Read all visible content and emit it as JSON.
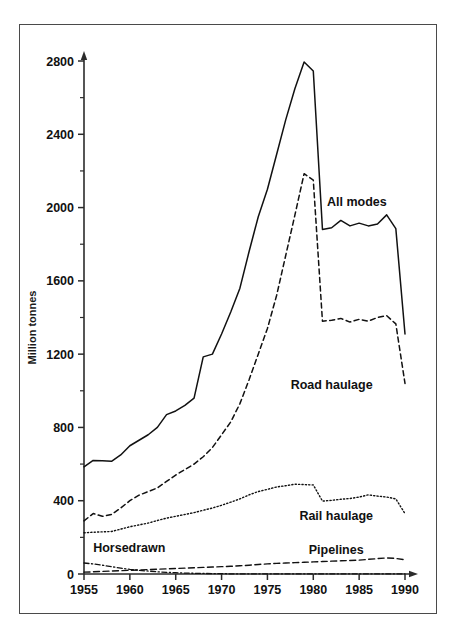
{
  "chart_data": {
    "type": "line",
    "title": "",
    "xlabel": "",
    "ylabel": "Million tonnes",
    "xlim": [
      1955,
      1990
    ],
    "ylim": [
      0,
      2800
    ],
    "yticks": [
      0,
      400,
      800,
      1200,
      1600,
      2000,
      2400,
      2800
    ],
    "ytick_labels": [
      "0",
      "400",
      "800",
      "1200",
      "1600",
      "2000",
      "2400",
      "2800"
    ],
    "yminor_step": 200,
    "xticks": [
      1955,
      1960,
      1965,
      1970,
      1975,
      1980,
      1985,
      1990
    ],
    "xtick_labels": [
      "1955",
      "1960",
      "1965",
      "1970",
      "1975",
      "1980",
      "1985",
      "1990"
    ],
    "grid": false,
    "legend_position": "inline-annotations",
    "x": [
      1955,
      1956,
      1957,
      1958,
      1959,
      1960,
      1961,
      1962,
      1963,
      1964,
      1965,
      1966,
      1967,
      1968,
      1969,
      1970,
      1971,
      1972,
      1973,
      1974,
      1975,
      1976,
      1977,
      1978,
      1979,
      1980,
      1981,
      1982,
      1983,
      1984,
      1985,
      1986,
      1987,
      1988,
      1989,
      1990
    ],
    "series": [
      {
        "name": "All modes",
        "style": "solid",
        "label_x": 1981.5,
        "label_y": 2010,
        "values": [
          585,
          620,
          618,
          615,
          650,
          700,
          730,
          760,
          800,
          870,
          890,
          920,
          960,
          1185,
          1200,
          1310,
          1430,
          1560,
          1760,
          1950,
          2100,
          2290,
          2480,
          2650,
          2795,
          2745,
          1880,
          1890,
          1930,
          1900,
          1915,
          1900,
          1910,
          1960,
          1885,
          1310
        ]
      },
      {
        "name": "Road haulage",
        "style": "dashed",
        "label_x": 1982.0,
        "label_y": 1010,
        "values": [
          290,
          330,
          315,
          325,
          360,
          400,
          430,
          450,
          470,
          505,
          540,
          570,
          600,
          640,
          690,
          760,
          830,
          930,
          1060,
          1200,
          1340,
          1520,
          1740,
          1960,
          2185,
          2150,
          1380,
          1385,
          1395,
          1375,
          1390,
          1380,
          1400,
          1410,
          1365,
          1040
        ]
      },
      {
        "name": "Rail haulage",
        "style": "dotted",
        "label_x": 1982.5,
        "label_y": 295,
        "values": [
          225,
          228,
          230,
          232,
          245,
          258,
          268,
          278,
          292,
          305,
          315,
          325,
          335,
          348,
          360,
          375,
          392,
          410,
          432,
          450,
          462,
          475,
          482,
          490,
          488,
          486,
          398,
          402,
          408,
          412,
          420,
          432,
          425,
          420,
          410,
          330
        ]
      },
      {
        "name": "Pipelines",
        "style": "dashdot",
        "label_x": 1982.5,
        "label_y": 110,
        "values": [
          10,
          12,
          14,
          16,
          18,
          20,
          22,
          24,
          26,
          28,
          30,
          32,
          34,
          36,
          38,
          40,
          42,
          45,
          48,
          52,
          55,
          58,
          60,
          62,
          64,
          66,
          68,
          70,
          72,
          74,
          76,
          80,
          84,
          88,
          85,
          78
        ]
      },
      {
        "name": "Horsedrawn",
        "style": "dashdotdot",
        "label_x": 1956.0,
        "label_y": 118,
        "values": [
          60,
          55,
          48,
          40,
          32,
          25,
          20,
          16,
          12,
          9,
          7,
          5,
          4,
          3,
          2,
          2,
          1,
          1,
          1,
          1,
          1,
          1,
          1,
          1,
          1,
          1,
          1,
          1,
          1,
          1,
          1,
          1,
          1,
          1,
          1,
          1
        ]
      }
    ]
  }
}
